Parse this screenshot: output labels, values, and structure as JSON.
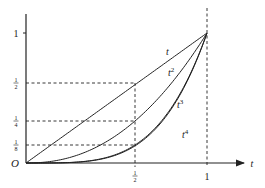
{
  "chart_data": {
    "type": "line",
    "title": "",
    "xlabel": "t",
    "ylabel": "",
    "origin_label": "O",
    "xlim": [
      0,
      1
    ],
    "ylim": [
      0,
      1
    ],
    "grid": false,
    "legend": "inline labels on curves",
    "x_ticks": [
      {
        "value": 0.5,
        "label": "1/2"
      },
      {
        "value": 1,
        "label": "1"
      }
    ],
    "y_ticks": [
      {
        "value": 1,
        "label": "1"
      },
      {
        "value": 0.5,
        "label": "1/2"
      },
      {
        "value": 0.25,
        "label": "1/4"
      },
      {
        "value": 0.125,
        "label": "1/8"
      }
    ],
    "series": [
      {
        "name": "t",
        "label": "t",
        "sup": "",
        "exponent": 1,
        "points": [
          [
            0,
            0
          ],
          [
            0.5,
            0.5
          ],
          [
            1,
            1
          ]
        ]
      },
      {
        "name": "t^2",
        "label": "t",
        "sup": "2",
        "exponent": 2,
        "points": [
          [
            0,
            0
          ],
          [
            0.5,
            0.25
          ],
          [
            1,
            1
          ]
        ]
      },
      {
        "name": "t^3",
        "label": "t",
        "sup": "3",
        "exponent": 3,
        "points": [
          [
            0,
            0
          ],
          [
            0.5,
            0.125
          ],
          [
            1,
            1
          ]
        ]
      },
      {
        "name": "t^4",
        "label": "t",
        "sup": "4",
        "exponent": 4,
        "points": [
          [
            0,
            0
          ],
          [
            0.5,
            0.0625
          ],
          [
            1,
            1
          ]
        ]
      }
    ],
    "annotations": [
      "dashed horizontal guide at y=1/2 to curve t at t=1/2",
      "dashed horizontal guide at y=1/4 to curve t^2 at t=1/2",
      "dashed horizontal guide at y=1/8 to curve t^3 at t=1/2",
      "dashed vertical guide at t=1/2",
      "dashed vertical guide at t=1"
    ]
  },
  "layout": {
    "origin_px": [
      26,
      163
    ],
    "unit_x_px": 181,
    "guide_y_px": {
      "0.5": 83,
      "0.25": 121,
      "0.125": 145
    },
    "half_x_px": 135,
    "one_y_px": 33,
    "axis_top_px": 14,
    "axis_right_px": 244,
    "label_pos": {
      "t": [
        166,
        55
      ],
      "t^2": [
        168,
        76
      ],
      "t^3": [
        177,
        108
      ],
      "t^4": [
        182,
        138
      ]
    }
  },
  "colors": {
    "ink": "#222222",
    "background": "#ffffff"
  }
}
